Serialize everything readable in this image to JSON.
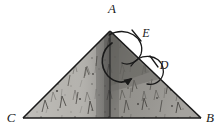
{
  "figure": {
    "type": "geometry-diagram",
    "background_color": "#ffffff",
    "stroke_color": "#1a1a1a",
    "fill_description": "textured grayscale grass-like shading",
    "fill_colors": {
      "left_panel": "#a9a7a2",
      "right_panel": "#b8b6b1",
      "shadow_band": "#8d8b87",
      "inner_shadow": "#7e7c78"
    }
  },
  "vertices": [
    {
      "id": "A",
      "label": "A",
      "x": 110,
      "y": 31,
      "label_x": 112,
      "label_y": 13,
      "role": "apex"
    },
    {
      "id": "C",
      "label": "C",
      "x": 23,
      "y": 118,
      "label_x": 11,
      "label_y": 122,
      "role": "bottom-left"
    },
    {
      "id": "B",
      "label": "B",
      "x": 201,
      "y": 118,
      "label_x": 210,
      "label_y": 122,
      "role": "bottom-right"
    }
  ],
  "angle_marks": [
    {
      "id": "E",
      "label": "E",
      "label_x": 146,
      "label_y": 37,
      "ticks": 1,
      "note": "arc at vertex A, right side"
    },
    {
      "id": "D",
      "label": "D",
      "label_x": 164,
      "label_y": 69,
      "ticks": 1,
      "note": "arc on segment AB, below E"
    }
  ],
  "fold_line": {
    "from": "A",
    "to_x": 110,
    "to_y": 118,
    "style": "crease"
  },
  "motion_arrow": {
    "name": "fold-arrow",
    "description": "curved arrow from near apex sweeping down and to the right",
    "head": {
      "x": 136,
      "y": 76
    }
  },
  "edges": [
    {
      "from": "A",
      "to": "C"
    },
    {
      "from": "A",
      "to": "B"
    },
    {
      "from": "C",
      "to": "B"
    }
  ]
}
